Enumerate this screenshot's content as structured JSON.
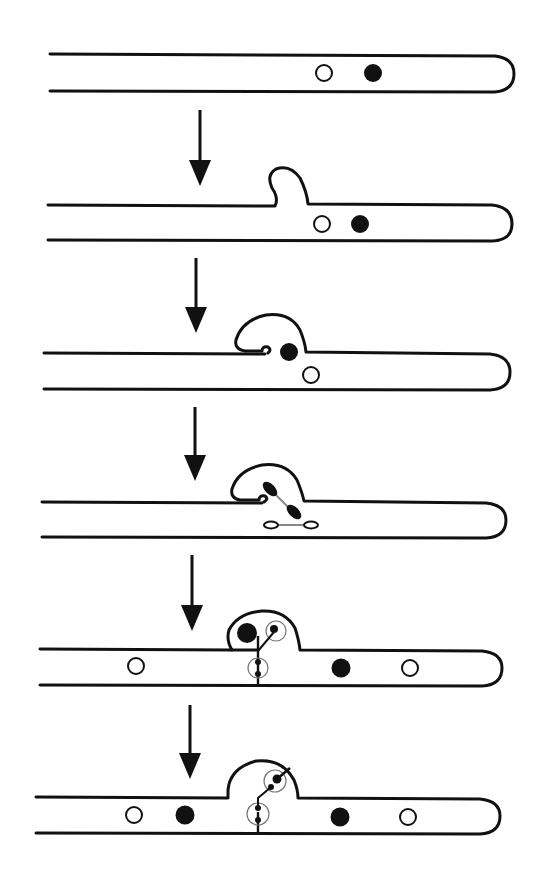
{
  "figure": {
    "stroke_color": "#111111",
    "background": "#ffffff",
    "stages": [
      {
        "id": 1,
        "label": "Binucleate hyphal tip",
        "nuclei": [
          {
            "type": "open",
            "x": 324,
            "y": 73
          },
          {
            "type": "filled",
            "x": 373,
            "y": 73
          }
        ]
      },
      {
        "id": 2,
        "label": "Clamp initial (hook) emerges",
        "nuclei": [
          {
            "type": "open",
            "x": 322,
            "y": 224
          },
          {
            "type": "filled",
            "x": 360,
            "y": 224
          }
        ]
      },
      {
        "id": 3,
        "label": "Hook curves back; nucleus enters hook",
        "nuclei": [
          {
            "type": "filled",
            "x": 289,
            "y": 352
          },
          {
            "type": "open",
            "x": 311,
            "y": 375
          }
        ]
      },
      {
        "id": 4,
        "label": "Conjugate nuclear division",
        "nuclei": []
      },
      {
        "id": 5,
        "label": "Septa form; one nucleus trapped in clamp",
        "nuclei": [
          {
            "type": "filled",
            "x": 247,
            "y": 633
          },
          {
            "type": "open",
            "x": 136,
            "y": 666
          },
          {
            "type": "filled",
            "x": 341,
            "y": 668
          },
          {
            "type": "open",
            "x": 410,
            "y": 668
          }
        ]
      },
      {
        "id": 6,
        "label": "Clamp fuses; nucleus released to subapical cell",
        "nuclei": [
          {
            "type": "open",
            "x": 134,
            "y": 815
          },
          {
            "type": "filled",
            "x": 185,
            "y": 815
          },
          {
            "type": "filled",
            "x": 340,
            "y": 817
          },
          {
            "type": "open",
            "x": 408,
            "y": 817
          }
        ]
      }
    ],
    "arrows": [
      {
        "x": 200,
        "y1": 110,
        "y2": 185
      },
      {
        "x": 196,
        "y1": 258,
        "y2": 332
      },
      {
        "x": 195,
        "y1": 407,
        "y2": 480
      },
      {
        "x": 192,
        "y1": 555,
        "y2": 630
      },
      {
        "x": 190,
        "y1": 705,
        "y2": 778
      }
    ],
    "legend": {
      "open_circle": "nucleus type A",
      "filled_circle": "nucleus type B"
    }
  }
}
